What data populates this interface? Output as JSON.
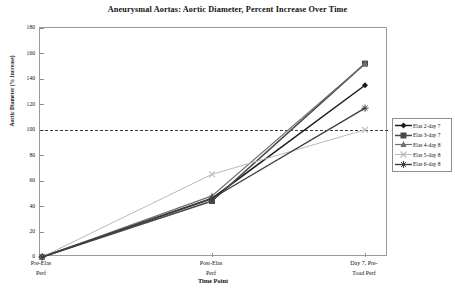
{
  "chart_data": {
    "type": "line",
    "title": "Aneurysmal Aortas:  Aortic Diameter, Percent Increase Over Time",
    "xlabel": "Time Point",
    "ylabel": "Aortic Diameter (% Increase)",
    "categories": [
      "Pre-Elas Perf",
      "Post-Elas Perf",
      "Day 7, Pre-Toad Perf"
    ],
    "x_tick_lines": [
      [
        "Pre-Elas",
        "Perf"
      ],
      [
        "Post-Elas",
        "Perf"
      ],
      [
        "Day 7, Pre-",
        "Toad Perf"
      ]
    ],
    "ylim": [
      0,
      180
    ],
    "yticks": [
      0,
      20,
      40,
      60,
      80,
      100,
      120,
      140,
      160,
      180
    ],
    "ytick_labels": [
      "0",
      "20",
      "40",
      "60",
      "80",
      "100",
      "120",
      "140",
      "160",
      "180"
    ],
    "grid": false,
    "reference_line": {
      "value": 100,
      "style": "dashed",
      "color": "#3a3a3a"
    },
    "legend_position": "right",
    "series": [
      {
        "name": "Elas 2-day 7",
        "marker": "diamond",
        "color": "#1c1c1c",
        "width": 1.5,
        "values": [
          0,
          46,
          135
        ]
      },
      {
        "name": "Elas 3-day 7",
        "marker": "square",
        "color": "#4a4a4a",
        "width": 1.5,
        "values": [
          0,
          44,
          152
        ]
      },
      {
        "name": "Elas 4-day 8",
        "marker": "triangle",
        "color": "#6e6e6e",
        "width": 1.2,
        "values": [
          0,
          48,
          152
        ]
      },
      {
        "name": "Elas 5-day 8",
        "marker": "x",
        "color": "#b9b9b9",
        "width": 1,
        "values": [
          0,
          65,
          100
        ]
      },
      {
        "name": "Elas 6-day 8",
        "marker": "asterisk",
        "color": "#3d3d3d",
        "width": 1.4,
        "values": [
          0,
          46,
          117
        ]
      }
    ]
  },
  "colors": {
    "frame": "#9a9a9a",
    "axis_text": "#111111",
    "background": "#ffffff",
    "reference": "#3a3a3a"
  }
}
